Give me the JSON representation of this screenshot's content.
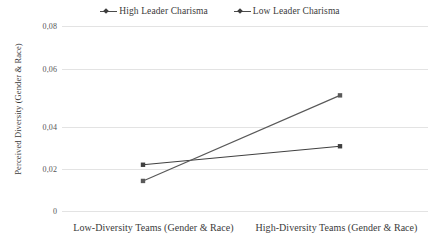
{
  "chart_data": {
    "type": "line",
    "title": "",
    "subtitle": "",
    "xlabel": "",
    "ylabel": "Perceived Diversity (Gender & Race)",
    "categories": [
      "Low-Diversity Teams (Gender & Race)",
      "High-Diversity Teams (Gender & Race)"
    ],
    "series": [
      {
        "name": "High Leader Charisma",
        "values": [
          0.02,
          0.028
        ],
        "color": "#404040",
        "marker": "diamond"
      },
      {
        "name": "Low Leader Charisma",
        "values": [
          0.013,
          0.05
        ],
        "color": "#595959",
        "marker": "diamond"
      }
    ],
    "ylim": [
      0,
      0.08
    ],
    "yticks": [
      0,
      0.02,
      0.04,
      0.06,
      0.08
    ],
    "ytick_labels": [
      "0",
      "0,02",
      "0,04",
      "0,06",
      "0,08"
    ],
    "grid": true,
    "grid_axis": "y",
    "grid_color": "#e3e3e3",
    "legend_position": "top-center",
    "background_color": "#ffffff",
    "decimal_separator": ","
  },
  "legend": {
    "entries": [
      {
        "label": "High Leader Charisma"
      },
      {
        "label": "Low Leader Charisma"
      }
    ]
  },
  "axes": {
    "y_title": "Perceived Diversity (Gender & Race)",
    "y_tick_labels": [
      "0,08",
      "0,06",
      "0,04",
      "0,02",
      "0"
    ],
    "x_tick_labels": [
      "Low-Diversity Teams (Gender & Race)",
      "High-Diversity Teams (Gender & Race)"
    ]
  }
}
